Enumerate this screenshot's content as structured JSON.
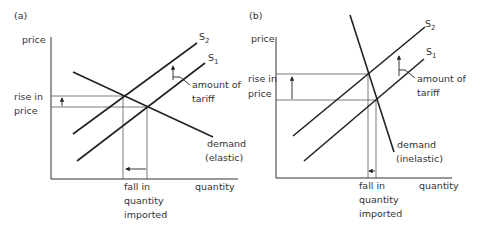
{
  "panels": [
    {
      "id": "a",
      "label": "(a)",
      "y_axis_label": "price",
      "x_axis_label": "quantity",
      "supply_curves": [
        {
          "name": "S",
          "subscript": "2"
        },
        {
          "name": "S",
          "subscript": "1"
        }
      ],
      "tariff_label": [
        "amount of",
        "tariff"
      ],
      "price_rise_label": [
        "rise in",
        "price"
      ],
      "demand_label": [
        "demand",
        "(elastic)"
      ],
      "quantity_fall_label": [
        "fall in",
        "quantity",
        "imported"
      ]
    },
    {
      "id": "b",
      "label": "(b)",
      "y_axis_label": "price",
      "x_axis_label": "quantity",
      "supply_curves": [
        {
          "name": "S",
          "subscript": "2"
        },
        {
          "name": "S",
          "subscript": "1"
        }
      ],
      "tariff_label": [
        "amount of",
        "tariff"
      ],
      "price_rise_label": [
        "rise in",
        "price"
      ],
      "demand_label": [
        "demand",
        "(inelastic)"
      ],
      "quantity_fall_label": [
        "fall in",
        "quantity",
        "imported"
      ]
    }
  ]
}
